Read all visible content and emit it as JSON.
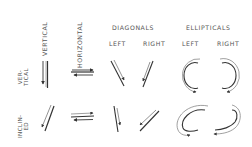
{
  "columns": {
    "vertical": "VERTICAL",
    "horizontal": "HORIZONTAL",
    "diagonals": "DIAGONALS",
    "diagonals_left": "LEFT",
    "diagonals_right": "RIGHT",
    "ellipticals": "ELLIPTICALS",
    "ellipticals_left": "LEFT",
    "ellipticals_right": "RIGHT"
  },
  "rows": [
    {
      "label_line1": "VER-",
      "label_line2": "TICAL"
    },
    {
      "label_line1": "INCLIN-",
      "label_line2": "ED"
    }
  ],
  "colors": {
    "stroke": "#333333",
    "light_stroke": "#888888",
    "text": "#555555"
  }
}
